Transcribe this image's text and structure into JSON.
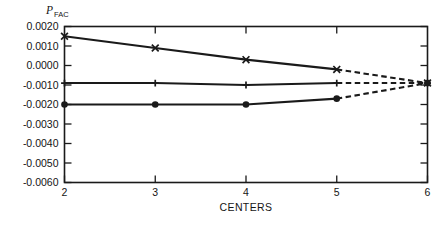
{
  "chart_data": {
    "type": "line",
    "title": "",
    "xlabel": "CENTERS",
    "ylabel": "P",
    "ylabel_sub": "FAC",
    "ylabel_full": "P_FAC",
    "x": [
      2,
      3,
      4,
      5,
      6
    ],
    "xlim": [
      2,
      6
    ],
    "ylim": [
      -0.006,
      0.002
    ],
    "xticks": [
      "2",
      "3",
      "4",
      "5",
      "6"
    ],
    "yticks": [
      "0.0020",
      "0.0010",
      "0.0000",
      "-0.0010",
      "-0.0020",
      "-0.0030",
      "-0.0040",
      "-0.0050",
      "-0.0060"
    ],
    "ytick_values": [
      0.002,
      0.001,
      0.0,
      -0.001,
      -0.002,
      -0.003,
      -0.004,
      -0.005,
      -0.006
    ],
    "grid": false,
    "legend": "none",
    "series": [
      {
        "name": "upper",
        "marker": "x",
        "values": [
          0.0015,
          0.0009,
          0.0003,
          -0.0002,
          -0.0009
        ],
        "solid_to_x": 5,
        "dashed_from_x": 5
      },
      {
        "name": "middle",
        "marker": "plus",
        "values": [
          -0.0009,
          -0.0009,
          -0.001,
          -0.0009,
          -0.0009
        ],
        "solid_to_x": 5,
        "dashed_from_x": 5
      },
      {
        "name": "lower",
        "marker": "dot",
        "values": [
          -0.002,
          -0.002,
          -0.002,
          -0.0017,
          -0.0009
        ],
        "solid_to_x": 5,
        "dashed_from_x": 5
      }
    ],
    "colors": {
      "ink": "#1a1a1a",
      "background": "#ffffff"
    }
  },
  "figure": {
    "axis_ticks_inward": true,
    "frame": "box"
  }
}
